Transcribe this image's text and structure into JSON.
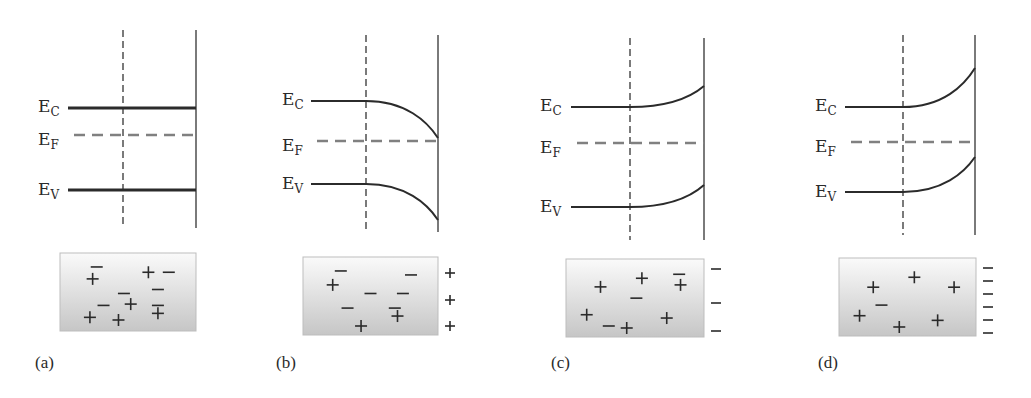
{
  "figure": {
    "level_labels": {
      "conduction": {
        "main": "E",
        "sub": "C"
      },
      "fermi": {
        "main": "E",
        "sub": "F"
      },
      "valence": {
        "main": "E",
        "sub": "V"
      }
    },
    "panels": [
      {
        "id": "a",
        "label": "(a)",
        "band_bending": "flat",
        "bulk_charges": [
          {
            "sign": "-",
            "col": 0.27,
            "row": 0.12
          },
          {
            "sign": "+",
            "col": 0.24,
            "row": 0.3
          },
          {
            "sign": "+",
            "col": 0.65,
            "row": 0.2
          },
          {
            "sign": "-",
            "col": 0.8,
            "row": 0.2
          },
          {
            "sign": "-",
            "col": 0.47,
            "row": 0.52
          },
          {
            "sign": "-",
            "col": 0.72,
            "row": 0.46
          },
          {
            "sign": "+",
            "col": 0.52,
            "row": 0.68
          },
          {
            "sign": "-",
            "col": 0.32,
            "row": 0.7
          },
          {
            "sign": "-",
            "col": 0.72,
            "row": 0.7
          },
          {
            "sign": "+",
            "col": 0.22,
            "row": 0.88
          },
          {
            "sign": "+",
            "col": 0.43,
            "row": 0.92
          },
          {
            "sign": "+",
            "col": 0.72,
            "row": 0.82
          }
        ],
        "surface_charges": []
      },
      {
        "id": "b",
        "label": "(b)",
        "band_bending": "downward",
        "bulk_charges": [
          {
            "sign": "-",
            "col": 0.28,
            "row": 0.12
          },
          {
            "sign": "+",
            "col": 0.22,
            "row": 0.33
          },
          {
            "sign": "-",
            "col": 0.8,
            "row": 0.18
          },
          {
            "sign": "-",
            "col": 0.5,
            "row": 0.46
          },
          {
            "sign": "-",
            "col": 0.74,
            "row": 0.46
          },
          {
            "sign": "-",
            "col": 0.33,
            "row": 0.68
          },
          {
            "sign": "-",
            "col": 0.68,
            "row": 0.68
          },
          {
            "sign": "+",
            "col": 0.7,
            "row": 0.8
          },
          {
            "sign": "+",
            "col": 0.43,
            "row": 0.95
          }
        ],
        "surface_charges": [
          "+",
          "+",
          "+"
        ]
      },
      {
        "id": "c",
        "label": "(c)",
        "band_bending": "upward",
        "bulk_charges": [
          {
            "sign": "+",
            "col": 0.25,
            "row": 0.33
          },
          {
            "sign": "+",
            "col": 0.55,
            "row": 0.2
          },
          {
            "sign": "-",
            "col": 0.82,
            "row": 0.14
          },
          {
            "sign": "+",
            "col": 0.83,
            "row": 0.3
          },
          {
            "sign": "-",
            "col": 0.51,
            "row": 0.5
          },
          {
            "sign": "+",
            "col": 0.15,
            "row": 0.75
          },
          {
            "sign": "-",
            "col": 0.31,
            "row": 0.92
          },
          {
            "sign": "+",
            "col": 0.44,
            "row": 0.95
          },
          {
            "sign": "+",
            "col": 0.73,
            "row": 0.8
          }
        ],
        "surface_charges": [
          "-",
          "-",
          "-"
        ]
      },
      {
        "id": "d",
        "label": "(d)",
        "band_bending": "strong-upward",
        "bulk_charges": [
          {
            "sign": "+",
            "col": 0.25,
            "row": 0.35
          },
          {
            "sign": "+",
            "col": 0.55,
            "row": 0.2
          },
          {
            "sign": "+",
            "col": 0.84,
            "row": 0.35
          },
          {
            "sign": "-",
            "col": 0.31,
            "row": 0.62
          },
          {
            "sign": "+",
            "col": 0.15,
            "row": 0.78
          },
          {
            "sign": "+",
            "col": 0.44,
            "row": 0.95
          },
          {
            "sign": "+",
            "col": 0.72,
            "row": 0.85
          }
        ],
        "surface_charges": [
          "-",
          "-",
          "-",
          "-",
          "-",
          "-"
        ]
      }
    ]
  }
}
